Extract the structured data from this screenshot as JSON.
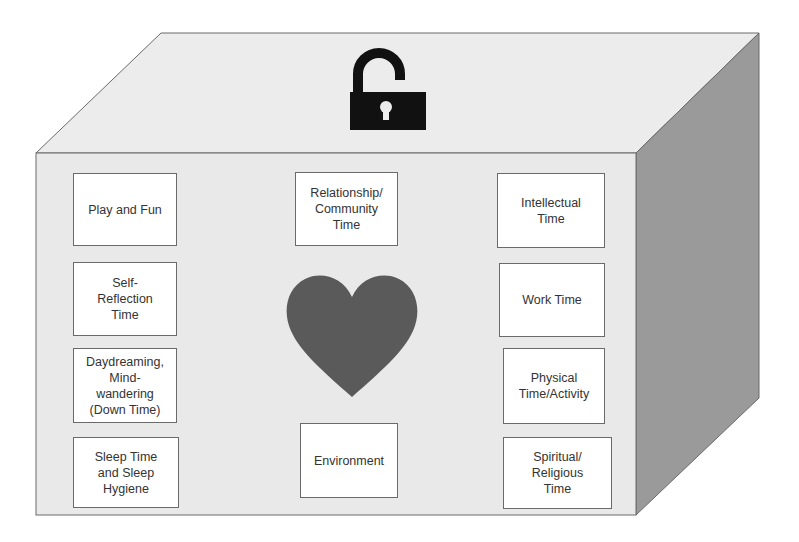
{
  "diagram": {
    "type": "3d-box",
    "colors": {
      "front_face": "#e9e9e9",
      "top_face": "#ececec",
      "side_face": "#9a9a9a",
      "outline": "#6a6a6a",
      "heart": "#5a5a5a",
      "lock": "#111111",
      "card_bg": "#ffffff",
      "card_text": "#333333"
    },
    "top_icon": "unlocked-padlock-icon",
    "center_icon": "heart-icon",
    "cards": [
      {
        "id": "play-and-fun",
        "lines": [
          "Play and Fun"
        ],
        "x": 73,
        "y": 173,
        "w": 104,
        "h": 73
      },
      {
        "id": "self-reflection-time",
        "lines": [
          "Self-",
          "Reflection",
          "Time"
        ],
        "x": 73,
        "y": 262,
        "w": 104,
        "h": 74
      },
      {
        "id": "daydreaming-mind-wandering",
        "lines": [
          "Daydreaming,",
          "Mind-",
          "wandering",
          "(Down Time)"
        ],
        "x": 73,
        "y": 348,
        "w": 104,
        "h": 75
      },
      {
        "id": "sleep-time-and-sleep-hygiene",
        "lines": [
          "Sleep Time",
          "and Sleep",
          "Hygiene"
        ],
        "x": 73,
        "y": 437,
        "w": 106,
        "h": 71
      },
      {
        "id": "relationship-community-time",
        "lines": [
          "Relationship/",
          "Community",
          "Time"
        ],
        "x": 295,
        "y": 172,
        "w": 103,
        "h": 74
      },
      {
        "id": "environment",
        "lines": [
          "Environment"
        ],
        "x": 300,
        "y": 423,
        "w": 98,
        "h": 75
      },
      {
        "id": "intellectual-time",
        "lines": [
          "Intellectual",
          "Time"
        ],
        "x": 497,
        "y": 173,
        "w": 108,
        "h": 75
      },
      {
        "id": "work-time",
        "lines": [
          "Work Time"
        ],
        "x": 499,
        "y": 263,
        "w": 106,
        "h": 74
      },
      {
        "id": "physical-time-activity",
        "lines": [
          "Physical",
          "Time/Activity"
        ],
        "x": 503,
        "y": 348,
        "w": 102,
        "h": 76
      },
      {
        "id": "spiritual-religious-time",
        "lines": [
          "Spiritual/",
          "Religious",
          "Time"
        ],
        "x": 503,
        "y": 437,
        "w": 109,
        "h": 72
      }
    ]
  }
}
